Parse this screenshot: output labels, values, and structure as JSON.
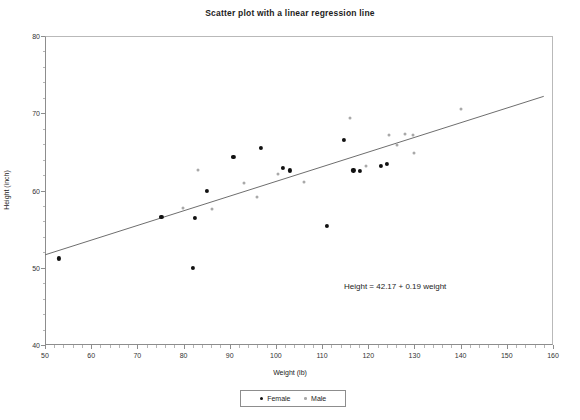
{
  "chart_data": {
    "type": "scatter",
    "title": "Scatter plot with a linear regression line",
    "xlabel": "Weight (lb)",
    "ylabel": "Height (inch)",
    "xlim": [
      50,
      160
    ],
    "ylim": [
      40,
      80
    ],
    "xticks": [
      50,
      60,
      70,
      80,
      90,
      100,
      110,
      120,
      130,
      140,
      150,
      160
    ],
    "yticks": [
      40,
      50,
      60,
      70,
      80
    ],
    "x_minor_step": 2,
    "y_minor_step": 2,
    "grid": false,
    "legend_position": "bottom-center",
    "annotation": "Height = 42.17 + 0.19 weight",
    "regression": {
      "intercept": 42.17,
      "slope": 0.19,
      "x_start": 50,
      "x_end": 158,
      "y_start": 51.67,
      "y_end": 72.19
    },
    "series": [
      {
        "name": "Female",
        "marker": "filled-circle",
        "color": "#111111",
        "points": [
          [
            53.0,
            51.2
          ],
          [
            75.2,
            56.6
          ],
          [
            82.0,
            50.0
          ],
          [
            82.4,
            56.4
          ],
          [
            85.0,
            59.9
          ],
          [
            90.8,
            64.4
          ],
          [
            96.7,
            65.5
          ],
          [
            101.5,
            62.9
          ],
          [
            103.0,
            62.6
          ],
          [
            111.0,
            55.4
          ],
          [
            114.8,
            66.6
          ],
          [
            116.8,
            62.6
          ],
          [
            118.2,
            62.5
          ],
          [
            122.8,
            63.2
          ],
          [
            124.0,
            63.4
          ]
        ]
      },
      {
        "name": "Male",
        "marker": "open-circle",
        "color": "#a9a9a9",
        "points": [
          [
            79.8,
            57.7
          ],
          [
            83.2,
            62.6
          ],
          [
            86.2,
            57.6
          ],
          [
            93.0,
            61.0
          ],
          [
            96.0,
            59.2
          ],
          [
            100.5,
            62.1
          ],
          [
            106.0,
            61.1
          ],
          [
            116.0,
            69.4
          ],
          [
            119.5,
            63.2
          ],
          [
            124.4,
            67.2
          ],
          [
            126.2,
            65.9
          ],
          [
            128.0,
            67.3
          ],
          [
            129.6,
            67.2
          ],
          [
            130.0,
            64.9
          ],
          [
            140.0,
            70.6
          ]
        ]
      }
    ]
  },
  "legend": {
    "items": [
      {
        "label": "Female"
      },
      {
        "label": "Male"
      }
    ]
  }
}
